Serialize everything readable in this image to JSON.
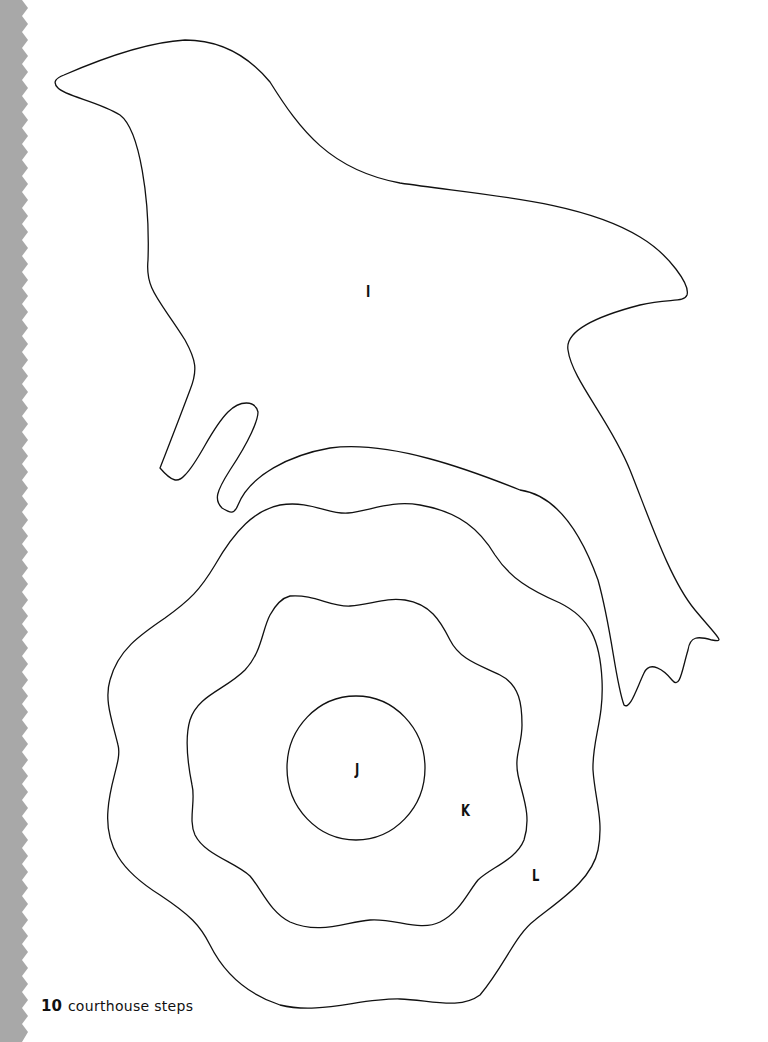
{
  "page": {
    "background": "#ffffff",
    "edge_strip_color": "#a8a8a8",
    "line_color": "#111111"
  },
  "pieces": [
    {
      "id": "bird",
      "label": "I"
    },
    {
      "id": "flower-center",
      "label": "J"
    },
    {
      "id": "flower-middle",
      "label": "K"
    },
    {
      "id": "flower-outer",
      "label": "L"
    }
  ],
  "footer": {
    "page_number": "10",
    "book_title": "courthouse steps"
  }
}
